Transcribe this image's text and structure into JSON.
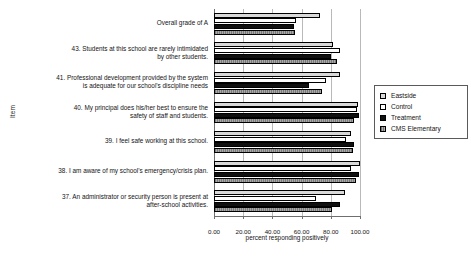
{
  "chart_data": {
    "type": "bar",
    "orientation": "horizontal",
    "title": "",
    "xlabel": "percent responding positively",
    "ylabel": "Item",
    "xlim": [
      0,
      100
    ],
    "xticks": [
      "0.00",
      "20.00",
      "40.00",
      "60.00",
      "80.00",
      "100.00"
    ],
    "xtick_values": [
      0,
      20,
      40,
      60,
      80,
      100
    ],
    "grid": true,
    "legend_position": "right",
    "categories": [
      "Overall grade of A",
      "43. Students at this school are rarely intimidated by other students.",
      "41. Professional development provided by the system is adequate for our school's discipline needs",
      "40. My principal does his/her best to ensure the safety of staff and students.",
      "39. I feel safe working at this school.",
      "38. I am aware of my school's emergency/crisis plan.",
      "37. An administrator or security person is present at after-school activities."
    ],
    "category_lines": [
      [
        "Overall grade of A"
      ],
      [
        "43. Students at this school are rarely intimidated",
        "by other students."
      ],
      [
        "41. Professional development provided by the system",
        "is adequate for our school's discipline needs"
      ],
      [
        "40. My principal does his/her best to ensure the",
        "safety of staff and students."
      ],
      [
        "39. I feel safe working at this school."
      ],
      [
        "38. I am aware of my school's emergency/crisis plan."
      ],
      [
        "37. An administrator or security person is present at",
        "after-school activities."
      ]
    ],
    "series": [
      {
        "name": "Eastside",
        "color": "#d9d9d9",
        "values": [
          72.5,
          81.5,
          86.0,
          98.5,
          94.0,
          100.0,
          90.0
        ]
      },
      {
        "name": "Control",
        "color": "#ffffff",
        "values": [
          56.0,
          86.5,
          77.0,
          98.0,
          90.5,
          93.5,
          70.0
        ]
      },
      {
        "name": "Treatment",
        "color": "#101010",
        "values": [
          55.0,
          80.0,
          65.0,
          99.0,
          96.0,
          99.5,
          86.0
        ]
      },
      {
        "name": "CMS Elementary",
        "color": "#8f8f8f",
        "values": [
          55.5,
          84.0,
          74.0,
          96.0,
          95.0,
          97.0,
          81.0
        ]
      }
    ]
  },
  "legend": {
    "items": [
      {
        "label": "Eastside",
        "key": "eastside"
      },
      {
        "label": "Control",
        "key": "control"
      },
      {
        "label": "Treatment",
        "key": "treatment"
      },
      {
        "label": "CMS Elementary",
        "key": "cms"
      }
    ]
  }
}
